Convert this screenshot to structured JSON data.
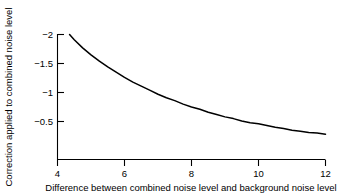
{
  "chart_data": {
    "type": "line",
    "title": "",
    "xlabel": "Difference between combined noise level and background noise level",
    "ylabel": "Correction applied to combined noise level",
    "xlim": [
      4,
      12
    ],
    "ylim": [
      -2.05,
      0
    ],
    "y_axis_inverted": true,
    "grid": false,
    "legend": null,
    "xticks": [
      4,
      6,
      8,
      10,
      12
    ],
    "xtick_labels": [
      "4",
      "6",
      "8",
      "10",
      "12"
    ],
    "yticks": [
      -2,
      -1.5,
      -1,
      -0.5
    ],
    "ytick_labels": [
      "−2",
      "−1.5",
      "−1",
      "−0.5"
    ],
    "line_color": "#000000",
    "series": [
      {
        "name": "Background noise correction",
        "x": [
          4.36,
          4.5,
          4.75,
          5.0,
          5.25,
          5.5,
          5.75,
          6.0,
          6.25,
          6.5,
          6.75,
          7.0,
          7.25,
          7.5,
          7.75,
          8.0,
          8.25,
          8.5,
          8.75,
          9.0,
          9.25,
          9.5,
          9.75,
          10.0,
          10.25,
          10.5,
          10.75,
          11.0,
          11.25,
          11.5,
          11.75,
          12.0
        ],
        "y": [
          -2.0,
          -1.91,
          -1.77,
          -1.65,
          -1.54,
          -1.44,
          -1.35,
          -1.26,
          -1.18,
          -1.11,
          -1.04,
          -0.97,
          -0.91,
          -0.86,
          -0.8,
          -0.75,
          -0.71,
          -0.66,
          -0.62,
          -0.58,
          -0.55,
          -0.51,
          -0.48,
          -0.46,
          -0.43,
          -0.4,
          -0.38,
          -0.35,
          -0.33,
          -0.31,
          -0.3,
          -0.28
        ]
      }
    ]
  },
  "axes": {
    "x_tick_label_0": "4",
    "x_tick_label_1": "6",
    "x_tick_label_2": "8",
    "x_tick_label_3": "10",
    "x_tick_label_4": "12",
    "y_tick_label_0": "−2",
    "y_tick_label_1": "−1.5",
    "y_tick_label_2": "−1",
    "y_tick_label_3": "−0.5",
    "x_axis_title": "Difference between combined noise level and background noise level",
    "y_axis_title": "Correction applied to combined noise level"
  }
}
